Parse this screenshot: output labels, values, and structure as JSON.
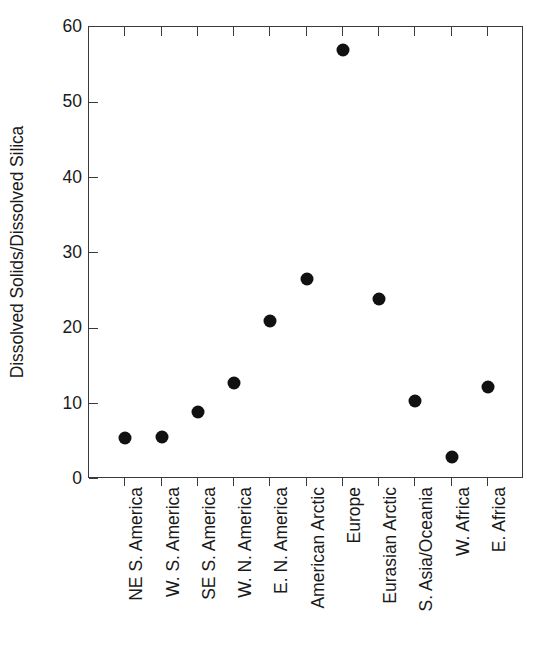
{
  "chart_data": {
    "type": "scatter",
    "title": "",
    "xlabel": "",
    "ylabel": "Dissolved Solids/Dissolved Silica",
    "ylim": [
      0,
      60
    ],
    "yticks": [
      0,
      10,
      20,
      30,
      40,
      50,
      60
    ],
    "ytick_labels": [
      "0",
      "10",
      "20",
      "30",
      "40",
      "50",
      "60"
    ],
    "grid": false,
    "legend": null,
    "marker": "filled-circle",
    "marker_color": "#111111",
    "categories": [
      "NE S. America",
      "W. S. America",
      "SE S. America",
      "W. N. America",
      "E. N. America",
      "American Arctic",
      "Europe",
      "Eurasian Arctic",
      "S. Asia/Oceania",
      "W. Africa",
      "E. Africa"
    ],
    "values": [
      5.4,
      5.6,
      8.9,
      12.8,
      21.0,
      26.5,
      57.0,
      23.9,
      10.3,
      2.9,
      12.2
    ],
    "points": [
      {
        "category": "NE S. America",
        "value": 5.4
      },
      {
        "category": "W. S. America",
        "value": 5.6
      },
      {
        "category": "SE S. America",
        "value": 8.9
      },
      {
        "category": "W. N. America",
        "value": 12.8
      },
      {
        "category": "E. N. America",
        "value": 21.0
      },
      {
        "category": "American Arctic",
        "value": 26.5
      },
      {
        "category": "Europe",
        "value": 57.0
      },
      {
        "category": "Eurasian Arctic",
        "value": 23.9
      },
      {
        "category": "S. Asia/Oceania",
        "value": 10.3
      },
      {
        "category": "W. Africa",
        "value": 2.9
      },
      {
        "category": "E. Africa",
        "value": 12.2
      }
    ]
  },
  "colors": {
    "axis": "#3a3a3a",
    "marker": "#111111",
    "text": "#1a1a1a",
    "background": "#ffffff"
  }
}
